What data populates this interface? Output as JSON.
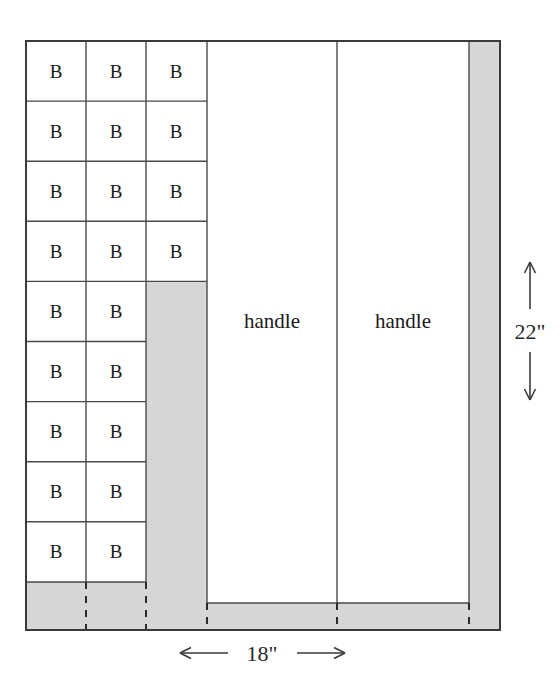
{
  "diagram": {
    "colors": {
      "waste_fill": "#d6d6d6",
      "panel_fill": "#ffffff",
      "stroke": "#4a4a4a",
      "heavy_stroke": "#3a3a3a",
      "text": "#1a1a1a",
      "background": "#ffffff"
    },
    "piece_label": "B",
    "piece_grid": {
      "columns": 3,
      "rows": 9,
      "column_3_rows": 4,
      "total_pieces": 22
    },
    "pieces": [
      {
        "id": "b-r1-c1",
        "label": "B",
        "row": 1,
        "col": 1
      },
      {
        "id": "b-r1-c2",
        "label": "B",
        "row": 1,
        "col": 2
      },
      {
        "id": "b-r1-c3",
        "label": "B",
        "row": 1,
        "col": 3
      },
      {
        "id": "b-r2-c1",
        "label": "B",
        "row": 2,
        "col": 1
      },
      {
        "id": "b-r2-c2",
        "label": "B",
        "row": 2,
        "col": 2
      },
      {
        "id": "b-r2-c3",
        "label": "B",
        "row": 2,
        "col": 3
      },
      {
        "id": "b-r3-c1",
        "label": "B",
        "row": 3,
        "col": 1
      },
      {
        "id": "b-r3-c2",
        "label": "B",
        "row": 3,
        "col": 2
      },
      {
        "id": "b-r3-c3",
        "label": "B",
        "row": 3,
        "col": 3
      },
      {
        "id": "b-r4-c1",
        "label": "B",
        "row": 4,
        "col": 1
      },
      {
        "id": "b-r4-c2",
        "label": "B",
        "row": 4,
        "col": 2
      },
      {
        "id": "b-r4-c3",
        "label": "B",
        "row": 4,
        "col": 3
      },
      {
        "id": "b-r5-c1",
        "label": "B",
        "row": 5,
        "col": 1
      },
      {
        "id": "b-r5-c2",
        "label": "B",
        "row": 5,
        "col": 2
      },
      {
        "id": "b-r6-c1",
        "label": "B",
        "row": 6,
        "col": 1
      },
      {
        "id": "b-r6-c2",
        "label": "B",
        "row": 6,
        "col": 2
      },
      {
        "id": "b-r7-c1",
        "label": "B",
        "row": 7,
        "col": 1
      },
      {
        "id": "b-r7-c2",
        "label": "B",
        "row": 7,
        "col": 2
      },
      {
        "id": "b-r8-c1",
        "label": "B",
        "row": 8,
        "col": 1
      },
      {
        "id": "b-r8-c2",
        "label": "B",
        "row": 8,
        "col": 2
      },
      {
        "id": "b-r9-c1",
        "label": "B",
        "row": 9,
        "col": 1
      },
      {
        "id": "b-r9-c2",
        "label": "B",
        "row": 9,
        "col": 2
      }
    ],
    "handles": [
      {
        "id": "handle-left",
        "label": "handle"
      },
      {
        "id": "handle-right",
        "label": "handle"
      }
    ],
    "dimensions": {
      "width": {
        "value": "18\"",
        "orientation": "horizontal",
        "position": "bottom"
      },
      "height": {
        "value": "22\"",
        "orientation": "vertical",
        "position": "right"
      }
    }
  }
}
